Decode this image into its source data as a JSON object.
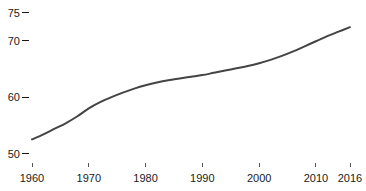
{
  "chart_data": {
    "type": "line",
    "title": "",
    "subtitle": "",
    "xlabel": "",
    "ylabel": "",
    "xlim": [
      1960,
      2016
    ],
    "ylim": [
      50,
      75
    ],
    "grid": false,
    "legend": false,
    "legend_position": "none",
    "line_color": "#444444",
    "line_width": 2,
    "background_color": "#ffffff",
    "text_color": "#1a1a1a",
    "y_ticks": [
      50,
      60,
      70,
      75
    ],
    "y_tick_labels": [
      "50",
      "60",
      "70",
      "75"
    ],
    "x_ticks": [
      1960,
      1970,
      1980,
      1990,
      2000,
      2010,
      2016
    ],
    "x_tick_labels": [
      "1960",
      "1970",
      "1980",
      "1990",
      "2000",
      "2010",
      "2016"
    ],
    "series": [
      {
        "name": "value",
        "x": [
          1960,
          1962,
          1964,
          1966,
          1968,
          1970,
          1972,
          1974,
          1976,
          1978,
          1980,
          1982,
          1984,
          1986,
          1988,
          1990,
          1992,
          1994,
          1996,
          1998,
          2000,
          2002,
          2004,
          2006,
          2008,
          2010,
          2012,
          2014,
          2016
        ],
        "values": [
          52.5,
          53.4,
          54.4,
          55.4,
          56.6,
          58.0,
          59.1,
          60.0,
          60.8,
          61.5,
          62.1,
          62.6,
          63.0,
          63.3,
          63.6,
          63.9,
          64.3,
          64.7,
          65.1,
          65.5,
          66.0,
          66.6,
          67.3,
          68.1,
          69.0,
          69.9,
          70.8,
          71.6,
          72.4
        ]
      }
    ]
  },
  "axes": {
    "y_axis_name": "y-axis",
    "x_axis_name": "x-axis"
  }
}
